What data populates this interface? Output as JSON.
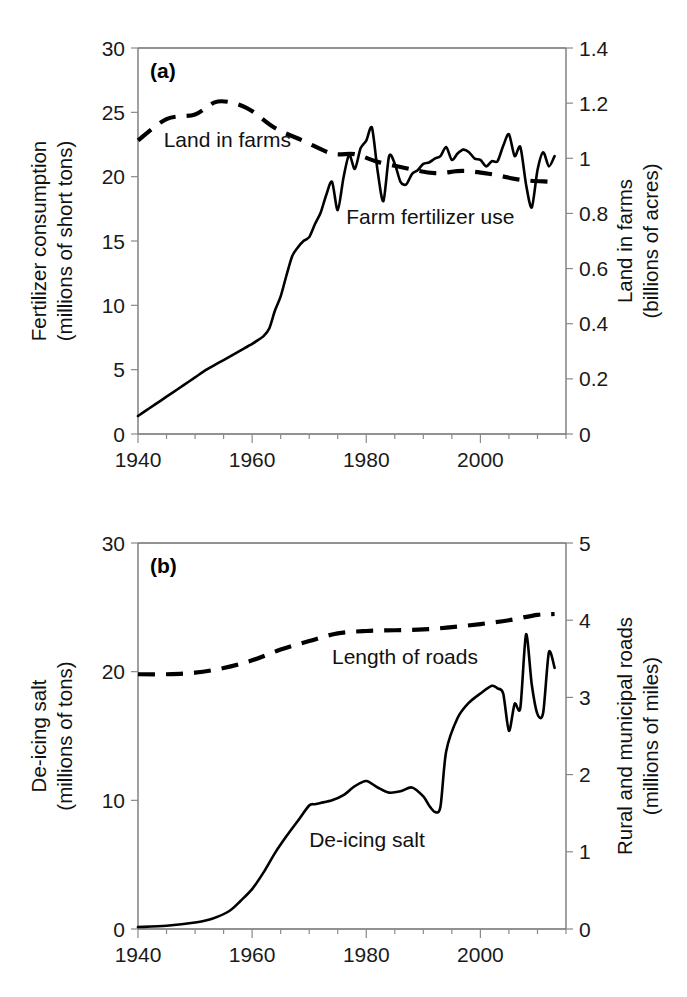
{
  "figure": {
    "background": "#ffffff",
    "line_color": "#000000",
    "axis_color": "#6e6e6e",
    "width": 687,
    "height": 997
  },
  "chart_data": [
    {
      "type": "line",
      "panel_tag": "(a)",
      "title": "",
      "xlabel": "",
      "ylabel": "Fertilizer consumption\n(millions of short tons)",
      "ylabel_line1": "Fertilizer consumption",
      "ylabel_line2": "(millions of short tons)",
      "y2label_line1": "Land in farms",
      "y2label_line2": "(billions of acres)",
      "xlim": [
        1940,
        2015
      ],
      "ylim": [
        0,
        30
      ],
      "y2lim": [
        0,
        1.4
      ],
      "xticks": [
        1940,
        1960,
        1980,
        2000
      ],
      "xtick_labels": [
        "1940",
        "1960",
        "1980",
        "2000"
      ],
      "xminor_step": 5,
      "yticks": [
        0,
        5,
        10,
        15,
        20,
        25,
        30
      ],
      "ytick_labels": [
        "0",
        "5",
        "10",
        "15",
        "20",
        "25",
        "30"
      ],
      "y2ticks": [
        0,
        0.2,
        0.4,
        0.6,
        0.8,
        1,
        1.2,
        1.4
      ],
      "y2tick_labels": [
        "0",
        "0.2",
        "0.4",
        "0.6",
        "0.8",
        "1",
        "1.2",
        "1.4"
      ],
      "grid": false,
      "legend_position": "inline-annotations",
      "annotations": [
        {
          "text": "Land in farms",
          "x": 1944.5,
          "y": 22.3,
          "anchor": "start",
          "axis": "left"
        },
        {
          "text": "Farm fertilizer use",
          "x": 1976.5,
          "y": 16.3,
          "anchor": "start",
          "axis": "left"
        }
      ],
      "series": [
        {
          "name": "Farm fertilizer use",
          "style": "solid",
          "axis": "left",
          "unit": "millions of short tons",
          "x": [
            1940,
            1942,
            1944,
            1946,
            1948,
            1950,
            1952,
            1954,
            1956,
            1958,
            1960,
            1961,
            1962,
            1963,
            1964,
            1965,
            1966,
            1967,
            1968,
            1969,
            1970,
            1971,
            1972,
            1973,
            1974,
            1975,
            1976,
            1977,
            1978,
            1979,
            1980,
            1981,
            1982,
            1983,
            1984,
            1985,
            1986,
            1987,
            1988,
            1989,
            1990,
            1991,
            1992,
            1993,
            1994,
            1995,
            1996,
            1997,
            1998,
            1999,
            2000,
            2001,
            2002,
            2003,
            2004,
            2005,
            2006,
            2007,
            2008,
            2009,
            2010,
            2011,
            2012,
            2013
          ],
          "values": [
            1.4,
            2.0,
            2.6,
            3.2,
            3.8,
            4.4,
            5.0,
            5.5,
            6.0,
            6.5,
            7.0,
            7.3,
            7.6,
            8.2,
            9.6,
            10.7,
            12.3,
            13.8,
            14.5,
            15.0,
            15.3,
            16.3,
            17.2,
            18.6,
            19.6,
            17.4,
            19.9,
            21.7,
            20.6,
            22.2,
            22.8,
            23.8,
            20.4,
            18.1,
            21.6,
            21.0,
            19.6,
            19.4,
            20.2,
            20.5,
            21.0,
            21.1,
            21.4,
            21.6,
            22.3,
            21.3,
            21.8,
            22.1,
            21.9,
            21.4,
            21.3,
            20.8,
            21.2,
            21.2,
            22.4,
            23.3,
            21.6,
            22.3,
            19.4,
            17.6,
            20.5,
            21.9,
            20.8,
            21.6
          ]
        },
        {
          "name": "Land in farms",
          "style": "dashed",
          "axis": "right",
          "unit": "billions of acres",
          "x": [
            1940,
            1945,
            1950,
            1954,
            1959,
            1964,
            1969,
            1974,
            1978,
            1982,
            1987,
            1992,
            1997,
            2002,
            2007,
            2012
          ],
          "values": [
            1.065,
            1.142,
            1.159,
            1.206,
            1.183,
            1.11,
            1.063,
            1.017,
            1.015,
            0.987,
            0.964,
            0.946,
            0.954,
            0.942,
            0.922,
            0.915
          ]
        }
      ]
    },
    {
      "type": "line",
      "panel_tag": "(b)",
      "title": "",
      "xlabel": "",
      "ylabel_line1": "De-icing salt",
      "ylabel_line2": "(millions of tons)",
      "y2label_line1": "Rural and municipal roads",
      "y2label_line2": "(millions of miles)",
      "xlim": [
        1940,
        2015
      ],
      "ylim": [
        0,
        30
      ],
      "y2lim": [
        0,
        5
      ],
      "xticks": [
        1940,
        1960,
        1980,
        2000
      ],
      "xtick_labels": [
        "1940",
        "1960",
        "1980",
        "2000"
      ],
      "xminor_step": 5,
      "yticks": [
        0,
        10,
        20,
        30
      ],
      "ytick_labels": [
        "0",
        "10",
        "20",
        "30"
      ],
      "y2ticks": [
        0,
        1,
        2,
        3,
        4,
        5
      ],
      "y2tick_labels": [
        "0",
        "1",
        "2",
        "3",
        "4",
        "5"
      ],
      "grid": false,
      "legend_position": "inline-annotations",
      "annotations": [
        {
          "text": "Length of roads",
          "x": 1974.0,
          "y": 20.6,
          "anchor": "start",
          "axis": "left"
        },
        {
          "text": "De-icing salt",
          "x": 1970.0,
          "y": 6.4,
          "anchor": "start",
          "axis": "left"
        }
      ],
      "series": [
        {
          "name": "De-icing salt",
          "style": "solid",
          "axis": "left",
          "unit": "millions of tons",
          "x": [
            1940,
            1945,
            1950,
            1953,
            1956,
            1958,
            1960,
            1962,
            1964,
            1966,
            1968,
            1970,
            1971,
            1972,
            1974,
            1976,
            1978,
            1980,
            1982,
            1984,
            1986,
            1988,
            1990,
            1991,
            1992,
            1993,
            1994,
            1996,
            1998,
            2000,
            2002,
            2003,
            2004,
            2005,
            2006,
            2007,
            2008,
            2009,
            2010,
            2011,
            2012,
            2013
          ],
          "values": [
            0.15,
            0.25,
            0.5,
            0.8,
            1.4,
            2.2,
            3.1,
            4.4,
            5.9,
            7.2,
            8.4,
            9.6,
            9.7,
            9.8,
            10.0,
            10.4,
            11.1,
            11.5,
            11.0,
            10.6,
            10.7,
            11.0,
            10.3,
            9.6,
            9.1,
            9.5,
            13.8,
            16.4,
            17.6,
            18.3,
            18.9,
            18.7,
            18.3,
            15.4,
            17.5,
            17.2,
            22.9,
            19.0,
            16.7,
            16.8,
            21.5,
            20.3
          ]
        },
        {
          "name": "Length of roads",
          "style": "dashed",
          "axis": "right",
          "unit": "millions of miles",
          "x": [
            1940,
            1945,
            1950,
            1955,
            1960,
            1965,
            1970,
            1975,
            1980,
            1985,
            1990,
            1995,
            2000,
            2005,
            2010,
            2013
          ],
          "values": [
            3.3,
            3.3,
            3.32,
            3.38,
            3.48,
            3.62,
            3.73,
            3.83,
            3.86,
            3.87,
            3.88,
            3.91,
            3.95,
            4.0,
            4.07,
            4.08
          ]
        }
      ]
    }
  ]
}
